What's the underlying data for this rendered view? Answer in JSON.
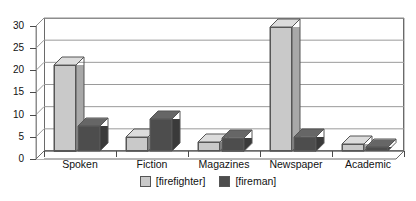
{
  "chart_data": {
    "type": "bar",
    "title": "",
    "xlabel": "",
    "ylabel": "",
    "ylim": [
      0,
      30
    ],
    "yticks": [
      0,
      5,
      10,
      15,
      20,
      25,
      30
    ],
    "grid": true,
    "legend_position": "bottom",
    "categories": [
      "Spoken",
      "Fiction",
      "Magazines",
      "Newspaper",
      "Academic"
    ],
    "series": [
      {
        "name": "[firefighter]",
        "color": "#c9c9c9",
        "values": [
          19.5,
          3.2,
          2.0,
          28.0,
          1.6
        ]
      },
      {
        "name": "[fireman]",
        "color": "#4d4d4d",
        "values": [
          5.6,
          7.2,
          3.0,
          3.2,
          0.8
        ]
      }
    ]
  },
  "axis": {
    "y_labels": [
      "30",
      "25",
      "20",
      "15",
      "10",
      "5",
      "0"
    ]
  },
  "legend": {
    "items": [
      {
        "label": "[firefighter]",
        "swatch": "light-gray-swatch"
      },
      {
        "label": "[fireman]",
        "swatch": "dark-gray-swatch"
      }
    ]
  }
}
